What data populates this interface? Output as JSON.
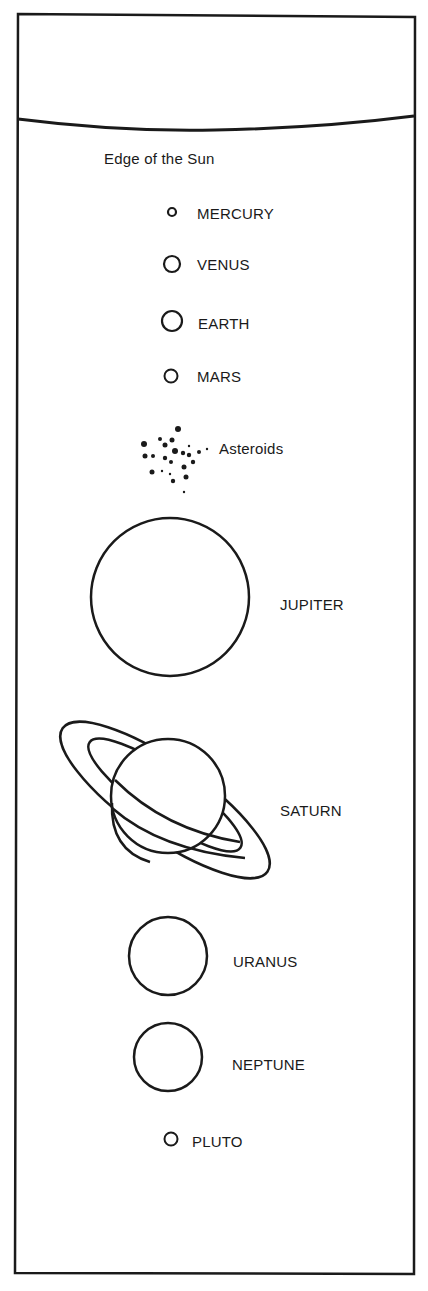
{
  "diagram": {
    "colors": {
      "ink": "#1a1a1a",
      "background": "#ffffff"
    },
    "sun": {
      "label": "Edge of the Sun"
    },
    "planets": [
      {
        "name": "MERCURY",
        "order": 1,
        "relative_size": "smallest"
      },
      {
        "name": "VENUS",
        "order": 2,
        "relative_size": "small"
      },
      {
        "name": "EARTH",
        "order": 3,
        "relative_size": "small"
      },
      {
        "name": "MARS",
        "order": 4,
        "relative_size": "small"
      },
      {
        "name": "Asteroids",
        "order": 5,
        "relative_size": "belt"
      },
      {
        "name": "JUPITER",
        "order": 6,
        "relative_size": "largest"
      },
      {
        "name": "SATURN",
        "order": 7,
        "relative_size": "large, ringed"
      },
      {
        "name": "URANUS",
        "order": 8,
        "relative_size": "medium"
      },
      {
        "name": "NEPTUNE",
        "order": 9,
        "relative_size": "medium"
      },
      {
        "name": "PLUTO",
        "order": 10,
        "relative_size": "small"
      }
    ]
  }
}
